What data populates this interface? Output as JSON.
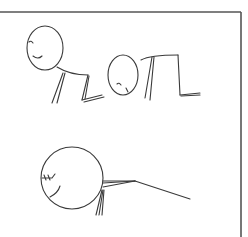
{
  "illustration": {
    "description": "Hand-drawn stick-figure panels showing a figure bending forward, on all fours, and lying face-down",
    "stroke_color": "#3a3a3a",
    "frame_color": "#555555",
    "background": "#ffffff",
    "frame": {
      "top_y": 12,
      "right_x": 241
    },
    "panels": [
      {
        "name": "figure-crouching",
        "head": {
          "cx": 45,
          "cy": 48,
          "rx": 18,
          "ry": 22
        },
        "face": {
          "eye": "M29 42 Q31 40 33 43",
          "smile": "M33 56 Q38 60 42 56"
        },
        "paths": [
          "M57 67 Q70 75 88 75",
          "M63 73 L52 103",
          "M65 73 L57 103",
          "M88 75 L82 100",
          "M89 76 L85 99",
          "M82 100 L102 95",
          "M84 102 L104 97"
        ]
      },
      {
        "name": "figure-all-fours",
        "head": {
          "cx": 123,
          "cy": 75,
          "rx": 15,
          "ry": 20
        },
        "face": {
          "eye": "M117 84 Q119 82 121 85",
          "smile": "M126 88 L128 92"
        },
        "paths": [
          "M141 60 Q150 55 178 55",
          "M152 57 L145 98",
          "M154 57 L150 100",
          "M178 55 L180 95",
          "M180 95 L200 93",
          "M181 96 L200 95"
        ]
      },
      {
        "name": "figure-lying",
        "head": {
          "cx": 72,
          "cy": 178,
          "rx": 31,
          "ry": 31
        },
        "face": {
          "eye": "M42 178 L52 178 M44 175 L46 180 M48 175 L50 180 M52 178 L55 174",
          "smile": "M50 197 Q58 193 60 186"
        },
        "paths": [
          "M103 181 L135 181",
          "M103 183 L135 181",
          "M103 187 L135 181",
          "M135 181 L190 199",
          "M102 190 L96 215",
          "M103 190 L99 215",
          "M104 190 L102 215"
        ]
      }
    ]
  }
}
